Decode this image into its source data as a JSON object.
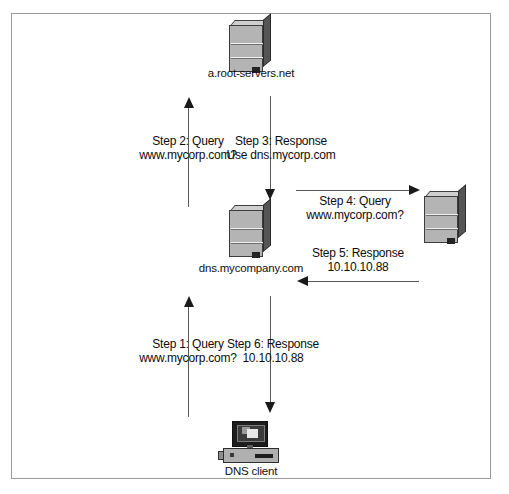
{
  "diagram": {
    "nodes": {
      "root_server": {
        "label": "a.root-servers.net",
        "icon": "server-icon"
      },
      "dns_server": {
        "label": "dns.mycompany.com",
        "icon": "server-icon"
      },
      "auth_server": {
        "label": "",
        "icon": "server-icon"
      },
      "client": {
        "label": "DNS client",
        "icon": "desktop-computer-icon"
      }
    },
    "steps": [
      {
        "id": "step1",
        "line1": "Step 1: Query",
        "line2": "www.mycorp.com?",
        "direction": "up"
      },
      {
        "id": "step2",
        "line1": "Step 2: Query",
        "line2": "www.mycorp.com?",
        "direction": "up"
      },
      {
        "id": "step3",
        "line1": "Step 3:  Response",
        "line2": "Use dns.mycorp.com",
        "direction": "down"
      },
      {
        "id": "step4",
        "line1": "Step 4:  Query",
        "line2": "www.mycorp.com?",
        "direction": "right"
      },
      {
        "id": "step5",
        "line1": "Step 5:  Response",
        "line2": "10.10.10.88",
        "direction": "left"
      },
      {
        "id": "step6",
        "line1": "Step 6:  Response",
        "line2": "10.10.10.88",
        "direction": "down"
      }
    ],
    "colors": {
      "frame": "#9a9a9a",
      "line": "#5a5a5a",
      "arrowhead": "#1a1a1a",
      "text": "#0d0d0d",
      "server_face": "#b4b4b4",
      "server_side": "#555555",
      "background": "#ffffff"
    }
  }
}
